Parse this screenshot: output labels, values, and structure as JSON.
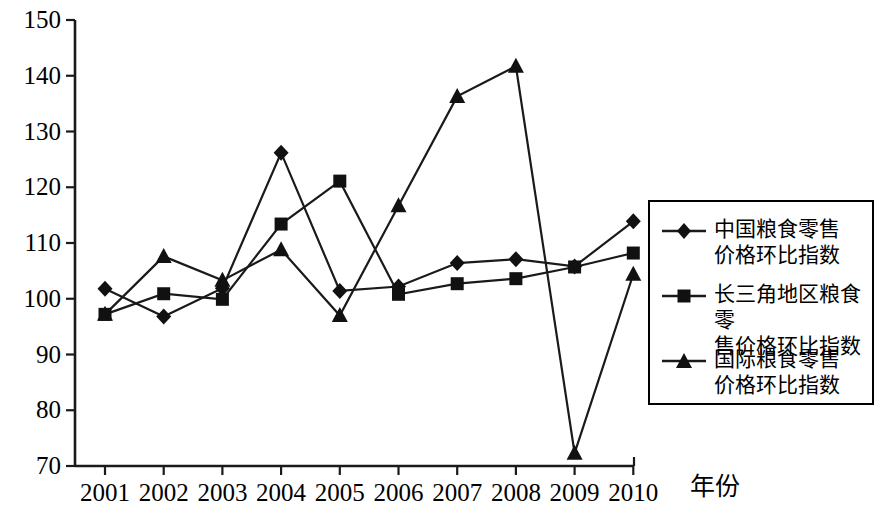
{
  "chart_data": {
    "type": "line",
    "title": "",
    "xlabel": "年份",
    "ylabel": "",
    "categories": [
      "2001",
      "2002",
      "2003",
      "2004",
      "2005",
      "2006",
      "2007",
      "2008",
      "2009",
      "2010"
    ],
    "xlim": [
      2001,
      2010
    ],
    "ylim": [
      70,
      150
    ],
    "yticks": [
      70,
      80,
      90,
      100,
      110,
      120,
      130,
      140,
      150
    ],
    "ytick_labels": [
      "70",
      "80",
      "90",
      "100",
      "110",
      "120",
      "130",
      "140",
      "150"
    ],
    "grid": false,
    "legend_position": "right",
    "series": [
      {
        "name": "中国粮食零售\n价格环比指数",
        "marker": "diamond",
        "color": "#000000",
        "values": [
          101.8,
          96.8,
          101.9,
          126.2,
          101.4,
          102.2,
          106.4,
          107.1,
          105.8,
          113.9
        ]
      },
      {
        "name": "长三角地区粮食零\n售价格环比指数",
        "marker": "square",
        "color": "#000000",
        "values": [
          97.2,
          100.9,
          99.9,
          113.4,
          121.1,
          100.8,
          102.7,
          103.6,
          105.7,
          108.2
        ]
      },
      {
        "name": "国际粮食零售\n价格环比指数",
        "marker": "triangle",
        "color": "#000000",
        "values": [
          97.2,
          107.6,
          103.3,
          108.8,
          97.0,
          116.7,
          136.3,
          141.7,
          72.3,
          104.4
        ]
      }
    ]
  },
  "axis": {
    "x_title": "年份",
    "x_tick_labels": [
      "2001",
      "2002",
      "2003",
      "2004",
      "2005",
      "2006",
      "2007",
      "2008",
      "2009",
      "2010"
    ],
    "y_tick_labels": [
      "150",
      "140",
      "130",
      "120",
      "110",
      "100",
      "90",
      "80",
      "70"
    ]
  },
  "legend": {
    "entries": [
      {
        "marker": "diamond-marker",
        "label": "中国粮食零售\n价格环比指数"
      },
      {
        "marker": "square-marker",
        "label": "长三角地区粮食零\n售价格环比指数"
      },
      {
        "marker": "triangle-marker",
        "label": "国际粮食零售\n价格环比指数"
      }
    ]
  },
  "colors": {
    "line": "#1a1a1a",
    "axis": "#1a1a1a",
    "background": "#ffffff"
  }
}
